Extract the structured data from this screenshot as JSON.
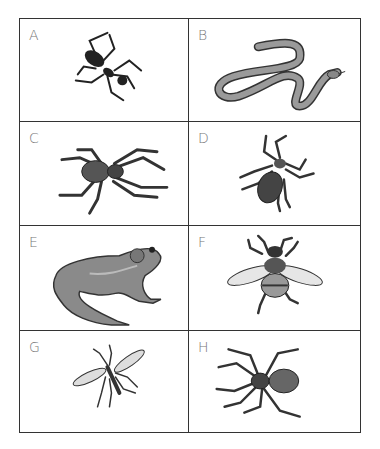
{
  "cards": [
    {
      "label": "A",
      "animal": "ant"
    },
    {
      "label": "B",
      "animal": "snake"
    },
    {
      "label": "C",
      "animal": "spider"
    },
    {
      "label": "D",
      "animal": "tick"
    },
    {
      "label": "E",
      "animal": "frog"
    },
    {
      "label": "F",
      "animal": "bee"
    },
    {
      "label": "G",
      "animal": "mosquito"
    },
    {
      "label": "H",
      "animal": "spider"
    }
  ]
}
